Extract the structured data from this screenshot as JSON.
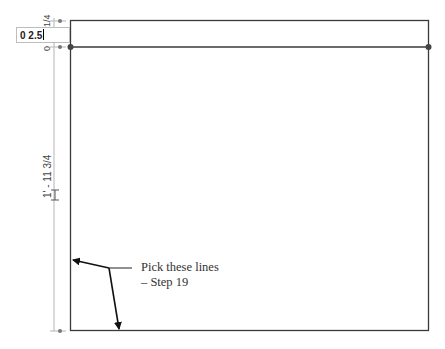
{
  "input": {
    "value": "0 2.5"
  },
  "dimensions": {
    "top_offset_label": "1/4",
    "zero_label": "0",
    "height_label": "1' - 11 3/4"
  },
  "callout": {
    "line1": "Pick these lines",
    "line2": "– Step 19"
  },
  "colors": {
    "outline": "#3a3a3a",
    "dimension_line": "#b0b0b0",
    "grip_dot": "#444444"
  }
}
